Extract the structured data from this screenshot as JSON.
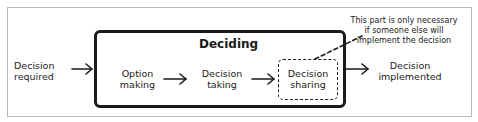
{
  "diagram": {
    "title": "Deciding",
    "input": {
      "line1": "Decision",
      "line2": "required"
    },
    "steps": [
      {
        "line1": "Option",
        "line2": "making",
        "style": "plain"
      },
      {
        "line1": "Decision",
        "line2": "taking",
        "style": "plain"
      },
      {
        "line1": "Decision",
        "line2": "sharing",
        "style": "dashed"
      }
    ],
    "output": {
      "line1": "Decision",
      "line2": "implemented"
    },
    "annotation": {
      "line1": "This part is only necessary",
      "line2": "if someone else will",
      "line3": "implement the decision",
      "target": "Decision sharing"
    },
    "colors": {
      "ink": "#1a1a1a",
      "frame": "#b8b8b8",
      "background": "#ffffff"
    }
  }
}
